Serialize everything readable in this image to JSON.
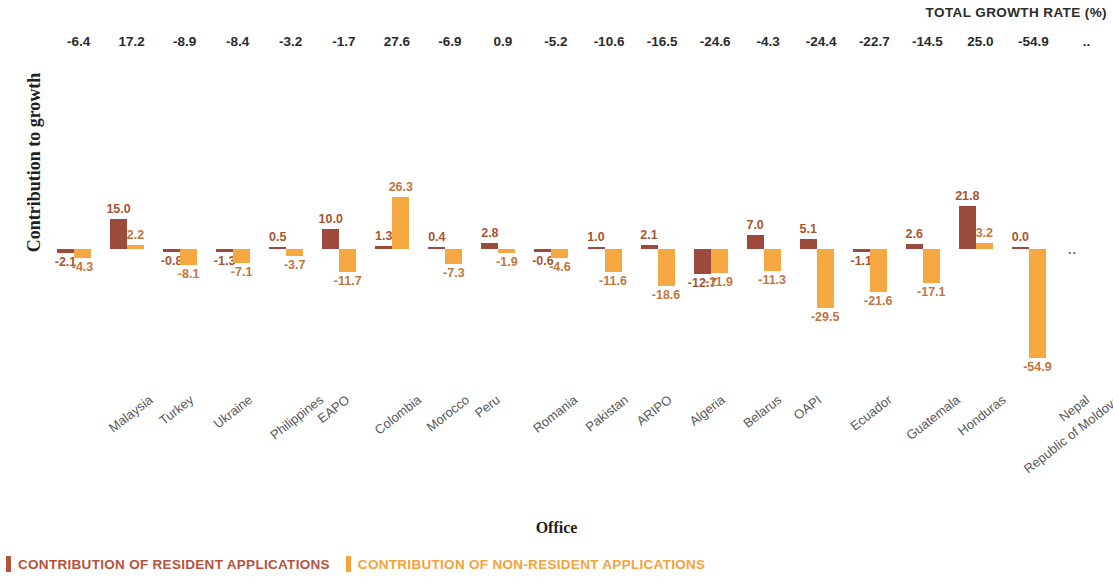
{
  "header": {
    "total_growth_label": "TOTAL GROWTH RATE (%)"
  },
  "axes": {
    "ylabel": "Contribution to growth",
    "xlabel": "Office"
  },
  "legend": {
    "position": "bottom-left",
    "items": [
      {
        "label": "CONTRIBUTION OF RESIDENT APPLICATIONS",
        "color": "#b4523f"
      },
      {
        "label": "CONTRIBUTION OF NON-RESIDENT APPLICATIONS",
        "color": "#f5a23c"
      }
    ]
  },
  "colors": {
    "resident": "#9c4a3c",
    "non_resident": "#f5a742",
    "label_text": "#a85432",
    "axis_text": "#59595b",
    "header_text": "#2b2b2b"
  },
  "no_data_marker": "..",
  "chart_data": {
    "type": "bar",
    "title": "",
    "subtitle": "",
    "xlabel": "Office",
    "ylabel": "Contribution to growth",
    "grid": false,
    "legend_position": "bottom-left",
    "ylim": [
      -60,
      30
    ],
    "categories": [
      "Malaysia",
      "Turkey",
      "Ukraine",
      "Philippines",
      "EAPO",
      "Colombia",
      "Morocco",
      "Peru",
      "Romania",
      "Pakistan",
      "ARIPO",
      "Algeria",
      "Belarus",
      "OAPI",
      "Ecuador",
      "Guatemala",
      "Honduras",
      "Republic of Moldova",
      "Nepal",
      "Ghana"
    ],
    "total_growth_rate": [
      "-6.4",
      "17.2",
      "-8.9",
      "-8.4",
      "-3.2",
      "-1.7",
      "27.6",
      "-6.9",
      "0.9",
      "-5.2",
      "-10.6",
      "-16.5",
      "-24.6",
      "-4.3",
      "-24.4",
      "-22.7",
      "-14.5",
      "25.0",
      "-54.9",
      ".."
    ],
    "series": [
      {
        "name": "CONTRIBUTION OF RESIDENT APPLICATIONS",
        "color": "#9c4a3c",
        "values": [
          -2.1,
          15.0,
          -0.8,
          -1.3,
          0.5,
          10.0,
          1.3,
          0.4,
          2.8,
          -0.6,
          1.0,
          2.1,
          -12.7,
          7.0,
          5.1,
          -1.1,
          2.6,
          21.8,
          0.0,
          null
        ],
        "labels": [
          "-2.1",
          "15.0",
          "-0.8",
          "-1.3",
          "0.5",
          "10.0",
          "1.3",
          "0.4",
          "2.8",
          "-0.6",
          "1.0",
          "2.1",
          "-12.7",
          "7.0",
          "5.1",
          "-1.1",
          "2.6",
          "21.8",
          "0.0",
          ".."
        ]
      },
      {
        "name": "CONTRIBUTION OF NON-RESIDENT APPLICATIONS",
        "color": "#f5a742",
        "values": [
          -4.3,
          2.2,
          -8.1,
          -7.1,
          -3.7,
          -11.7,
          26.3,
          -7.3,
          -1.9,
          -4.6,
          -11.6,
          -18.6,
          -11.9,
          -11.3,
          -29.5,
          -21.6,
          -17.1,
          3.2,
          -54.9,
          null
        ],
        "labels": [
          "-4.3",
          "2.2",
          "-8.1",
          "-7.1",
          "-3.7",
          "-11.7",
          "26.3",
          "-7.3",
          "-1.9",
          "-4.6",
          "-11.6",
          "-18.6",
          "-11.9",
          "-11.3",
          "-29.5",
          "-21.6",
          "-17.1",
          "3.2",
          "-54.9",
          ".."
        ]
      }
    ]
  }
}
